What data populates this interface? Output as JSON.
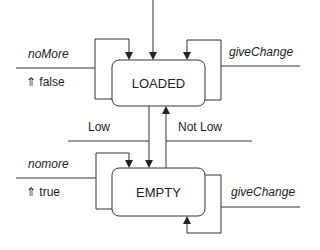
{
  "diagram": {
    "type": "state-machine",
    "states": [
      {
        "id": "loaded",
        "label": "LOADED"
      },
      {
        "id": "empty",
        "label": "EMPTY"
      }
    ],
    "transitions": [
      {
        "from": "initial",
        "to": "loaded",
        "label": ""
      },
      {
        "from": "loaded",
        "to": "loaded",
        "event": "noMore",
        "output": "⇑ false"
      },
      {
        "from": "loaded",
        "to": "loaded",
        "event": "giveChange"
      },
      {
        "from": "loaded",
        "to": "empty",
        "label": "Low"
      },
      {
        "from": "empty",
        "to": "loaded",
        "label": "Not Low"
      },
      {
        "from": "empty",
        "to": "empty",
        "event": "nomore",
        "output": "⇑ true"
      },
      {
        "from": "empty",
        "to": "empty",
        "event": "giveChange"
      }
    ],
    "labels": {
      "loaded_left_event": "noMore",
      "loaded_left_output": "⇑ false",
      "loaded_right_event": "giveChange",
      "low": "Low",
      "not_low": "Not Low",
      "empty_left_event": "nomore",
      "empty_left_output": "⇑ true",
      "empty_right_event": "giveChange"
    },
    "colors": {
      "line": "#333333",
      "background": "#ffffff"
    }
  }
}
